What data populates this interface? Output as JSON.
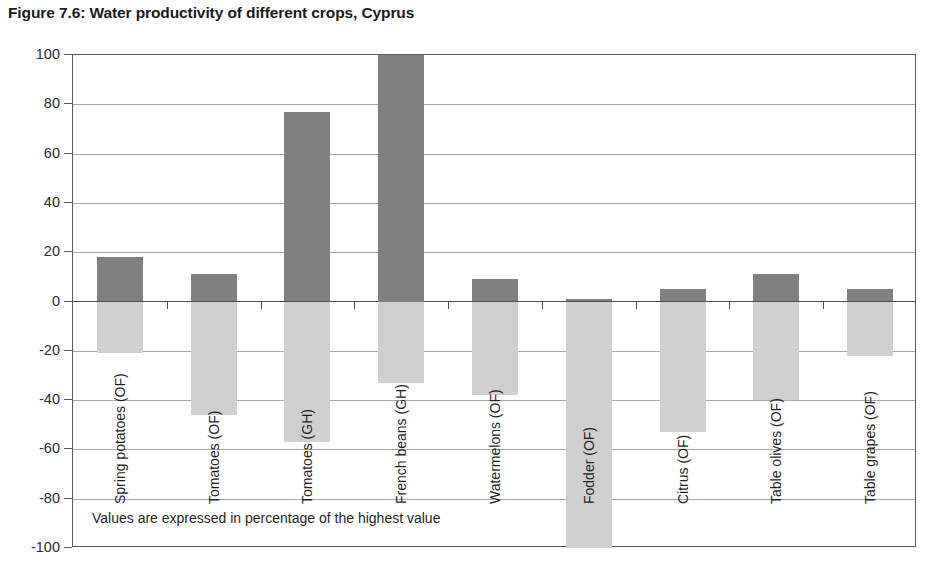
{
  "figure": {
    "title": "Figure 7.6: Water productivity of different crops, Cyprus",
    "footnote": "Values are expressed in percentage of the highest value"
  },
  "colors": {
    "positive_bar": "#808080",
    "negative_bar": "#cfcfcf",
    "gridline": "#a6a6a6",
    "zero_line": "#4d4d4d",
    "frame": "#595959",
    "text": "#1f1f1f"
  },
  "chart_data": {
    "type": "bar",
    "title": "Figure 7.6: Water productivity of different crops, Cyprus",
    "subtitle": "",
    "xlabel": "",
    "ylabel": "",
    "ylim": [
      -100,
      100
    ],
    "ytick_step": 20,
    "yticks": [
      100,
      80,
      60,
      40,
      20,
      0,
      -20,
      -40,
      -60,
      -80,
      -100
    ],
    "ytick_labels": [
      "100",
      "80",
      "60",
      "40",
      "20",
      "0",
      "-20",
      "-40",
      "-60",
      "-80",
      "-100"
    ],
    "grid": true,
    "legend": "none",
    "annotations": [
      "Values are expressed in percentage of the highest value"
    ],
    "categories": [
      "Spring potatoes (OF)",
      "Tomatoes (OF)",
      "Tomatoes (GH)",
      "French beans (GH)",
      "Watermelons (OF)",
      "Fodder (OF)",
      "Citrus (OF)",
      "Table olives (OF)",
      "Table grapes (OF)"
    ],
    "series": [
      {
        "name": "Positive value",
        "color": "#808080",
        "values": [
          18,
          11,
          77,
          100,
          9,
          1,
          5,
          11,
          5
        ]
      },
      {
        "name": "Negative value",
        "color": "#cfcfcf",
        "values": [
          -21,
          -46,
          -57,
          -33,
          -38,
          -100,
          -53,
          -40,
          -22
        ]
      }
    ]
  }
}
